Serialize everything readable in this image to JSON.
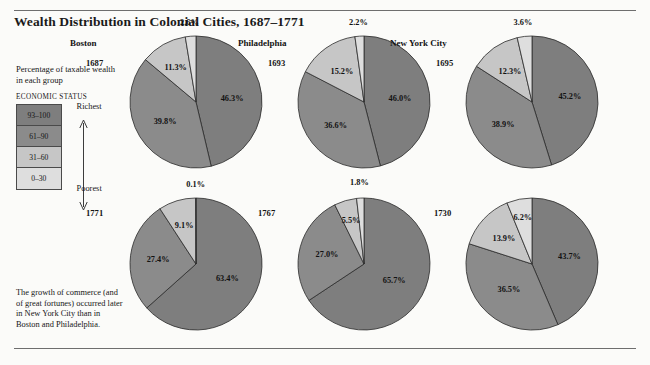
{
  "title": "Wealth Distribution in Colonial Cities, 1687–1771",
  "legend": {
    "caption": "Percentage of taxable wealth in each group",
    "heading": "ECONOMIC STATUS",
    "top_label": "Richest",
    "bottom_label": "Poorest",
    "bands": [
      {
        "label": "93–100",
        "color": "#7e7e7e"
      },
      {
        "label": "61–90",
        "color": "#8b8b8b"
      },
      {
        "label": "31–60",
        "color": "#c6c6c6"
      },
      {
        "label": "0–30",
        "color": "#dedede"
      }
    ]
  },
  "footnote": "The growth of commerce (and of great fortunes) occurred later in New York City than in Boston and Philadelphia.",
  "chart_data": {
    "type": "pie",
    "title": "Wealth Distribution in Colonial Cities, 1687–1771",
    "legend_position": "left",
    "group_labels": [
      "93–100",
      "61–90",
      "31–60",
      "0–30"
    ],
    "group_colors": [
      "#7e7e7e",
      "#8b8b8b",
      "#c6c6c6",
      "#dedede"
    ],
    "unit": "percent of taxable wealth",
    "charts": [
      {
        "city": "Boston",
        "year": "1687",
        "values": [
          46.3,
          39.8,
          11.3,
          2.6
        ],
        "labels": [
          "46.3%",
          "39.8%",
          "11.3%",
          "2.6%"
        ]
      },
      {
        "city": "Philadelphia",
        "year": "1693",
        "values": [
          46.0,
          36.6,
          15.2,
          2.2
        ],
        "labels": [
          "46.0%",
          "36.6%",
          "15.2%",
          "2.2%"
        ]
      },
      {
        "city": "New York City",
        "year": "1695",
        "values": [
          45.2,
          38.9,
          12.3,
          3.6
        ],
        "labels": [
          "45.2%",
          "38.9%",
          "12.3%",
          "3.6%"
        ]
      },
      {
        "city": "",
        "year": "1771",
        "values": [
          63.4,
          27.4,
          9.1,
          0.1
        ],
        "labels": [
          "63.4%",
          "27.4%",
          "9.1%",
          "0.1%"
        ]
      },
      {
        "city": "",
        "year": "1767",
        "values": [
          65.7,
          27.0,
          5.5,
          1.8
        ],
        "labels": [
          "65.7%",
          "27.0%",
          "5.5%",
          "1.8%"
        ]
      },
      {
        "city": "",
        "year": "1730",
        "values": [
          43.7,
          36.5,
          13.9,
          6.2
        ],
        "labels": [
          "43.7%",
          "36.5%",
          "13.9%",
          "6.2%"
        ]
      }
    ]
  }
}
